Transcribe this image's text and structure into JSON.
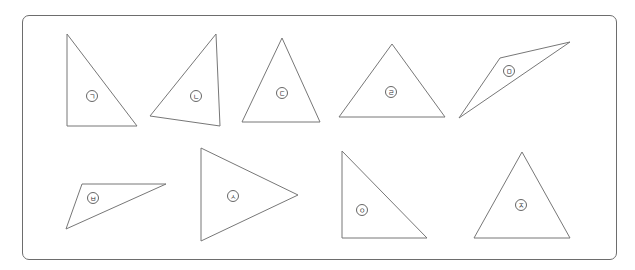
{
  "figure": {
    "frame": {
      "left": 22,
      "top": 15,
      "width": 595,
      "height": 245
    },
    "triangles": [
      {
        "label": "ㄱ",
        "points": [
          [
            67,
            34
          ],
          [
            67,
            126
          ],
          [
            137,
            126
          ]
        ],
        "label_pos": [
          92,
          96
        ]
      },
      {
        "label": "ㄴ",
        "points": [
          [
            216,
            34
          ],
          [
            150,
            116
          ],
          [
            220,
            126
          ]
        ],
        "label_pos": [
          196,
          96
        ]
      },
      {
        "label": "ㄷ",
        "points": [
          [
            282,
            38
          ],
          [
            242,
            122
          ],
          [
            320,
            122
          ]
        ],
        "label_pos": [
          282,
          93
        ]
      },
      {
        "label": "ㄹ",
        "points": [
          [
            392,
            44
          ],
          [
            339,
            117
          ],
          [
            445,
            117
          ]
        ],
        "label_pos": [
          391,
          92
        ]
      },
      {
        "label": "ㅁ",
        "points": [
          [
            570,
            42
          ],
          [
            500,
            58
          ],
          [
            459,
            118
          ]
        ],
        "label_pos": [
          509,
          71
        ]
      },
      {
        "label": "ㅂ",
        "points": [
          [
            82,
            184
          ],
          [
            166,
            184
          ],
          [
            66,
            229
          ]
        ],
        "label_pos": [
          93,
          198
        ]
      },
      {
        "label": "ㅅ",
        "points": [
          [
            201,
            148
          ],
          [
            298,
            195
          ],
          [
            201,
            241
          ]
        ],
        "label_pos": [
          233,
          196
        ]
      },
      {
        "label": "ㅇ",
        "points": [
          [
            342,
            151
          ],
          [
            342,
            238
          ],
          [
            427,
            238
          ]
        ],
        "label_pos": [
          362,
          210
        ]
      },
      {
        "label": "ㅈ",
        "points": [
          [
            522,
            152
          ],
          [
            474,
            238
          ],
          [
            570,
            238
          ]
        ],
        "label_pos": [
          521,
          205
        ]
      }
    ]
  },
  "colors": {
    "stroke": "#777777",
    "frame": "#6d6d6d"
  }
}
